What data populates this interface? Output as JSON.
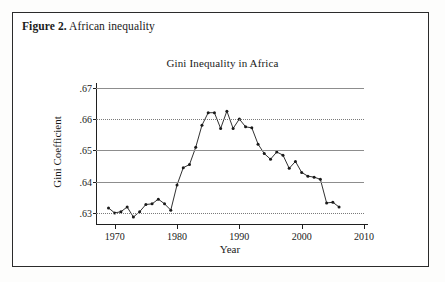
{
  "figure": {
    "caption_label": "Figure 2.",
    "caption_text": " African inequality"
  },
  "chart_data": {
    "type": "line",
    "title": "Gini Inequality in Africa",
    "xlabel": "Year",
    "ylabel": "Gini Coefficient",
    "xlim": [
      1967,
      2010
    ],
    "ylim": [
      0.6285,
      0.6705
    ],
    "xticks": [
      1970,
      1980,
      1990,
      2000,
      2010
    ],
    "xtick_labels": [
      "1970",
      "1980",
      "1990",
      "2000",
      "2010"
    ],
    "yticks": [
      0.63,
      0.64,
      0.65,
      0.66,
      0.67
    ],
    "ytick_labels": [
      ".63",
      ".64",
      ".65",
      ".66",
      ".67"
    ],
    "gridlines": [
      {
        "value": 0.67,
        "style": "solid"
      },
      {
        "value": 0.66,
        "style": "dotted"
      },
      {
        "value": 0.65,
        "style": "solid"
      },
      {
        "value": 0.64,
        "style": "solid"
      },
      {
        "value": 0.63,
        "style": "dotted"
      }
    ],
    "grid": true,
    "legend": null,
    "marker": "filled-circle",
    "line_color": "#1a1a1a",
    "x": [
      1969,
      1970,
      1971,
      1972,
      1973,
      1974,
      1975,
      1976,
      1977,
      1978,
      1979,
      1980,
      1981,
      1982,
      1983,
      1984,
      1985,
      1986,
      1987,
      1988,
      1989,
      1990,
      1991,
      1992,
      1993,
      1994,
      1995,
      1996,
      1997,
      1998,
      1999,
      2000,
      2001,
      2002,
      2003,
      2004,
      2005,
      2006
    ],
    "values": [
      0.6317,
      0.6301,
      0.6305,
      0.632,
      0.6288,
      0.6305,
      0.6328,
      0.633,
      0.6345,
      0.633,
      0.631,
      0.639,
      0.6445,
      0.6455,
      0.651,
      0.658,
      0.662,
      0.662,
      0.657,
      0.6625,
      0.657,
      0.66,
      0.6575,
      0.6572,
      0.652,
      0.649,
      0.6472,
      0.6495,
      0.6485,
      0.6443,
      0.6465,
      0.643,
      0.6418,
      0.6415,
      0.6408,
      0.6333,
      0.6335,
      0.632
    ],
    "series": [
      {
        "name": "Gini Coefficient",
        "values": [
          0.6317,
          0.6301,
          0.6305,
          0.632,
          0.6288,
          0.6305,
          0.6328,
          0.633,
          0.6345,
          0.633,
          0.631,
          0.639,
          0.6445,
          0.6455,
          0.651,
          0.658,
          0.662,
          0.662,
          0.657,
          0.6625,
          0.657,
          0.66,
          0.6575,
          0.6572,
          0.652,
          0.649,
          0.6472,
          0.6495,
          0.6485,
          0.6443,
          0.6465,
          0.643,
          0.6418,
          0.6415,
          0.6408,
          0.6333,
          0.6335,
          0.632
        ]
      }
    ]
  }
}
